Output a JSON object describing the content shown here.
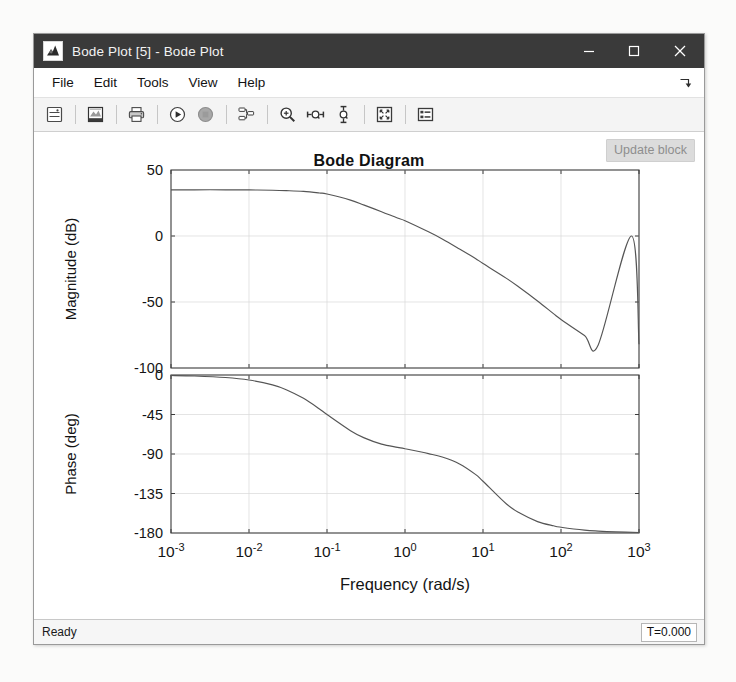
{
  "window": {
    "title": "Bode Plot [5] - Bode Plot",
    "app_icon": "matlab-membrane-icon",
    "controls": {
      "minimize": "minimize-icon",
      "maximize": "maximize-icon",
      "close": "close-icon"
    }
  },
  "menubar": {
    "items": [
      {
        "label": "File"
      },
      {
        "label": "Edit"
      },
      {
        "label": "Tools"
      },
      {
        "label": "View"
      },
      {
        "label": "Help"
      }
    ],
    "dock_arrow": "undock-arrow-icon"
  },
  "toolbar": {
    "buttons": [
      {
        "name": "print-preview-icon",
        "tip": "Print Preview"
      },
      {
        "name": "image-export-icon",
        "tip": "Export Image"
      },
      {
        "name": "print-icon",
        "tip": "Print"
      },
      {
        "name": "run-icon",
        "tip": "Run"
      },
      {
        "name": "stop-icon",
        "tip": "Stop"
      },
      {
        "name": "linearization-hierarchy-icon",
        "tip": "Linearization"
      },
      {
        "name": "zoom-in-icon",
        "tip": "Zoom In"
      },
      {
        "name": "zoom-x-icon",
        "tip": "Zoom X"
      },
      {
        "name": "zoom-y-icon",
        "tip": "Zoom Y"
      },
      {
        "name": "fit-to-view-icon",
        "tip": "Fit to View"
      },
      {
        "name": "legend-icon",
        "tip": "Legend"
      }
    ]
  },
  "figure": {
    "update_block_label": "Update block",
    "title": "Bode Diagram"
  },
  "statusbar": {
    "status": "Ready",
    "time": "T=0.000"
  },
  "chart_data": {
    "type": "line",
    "title": "Bode Diagram",
    "xlabel": "Frequency  (rad/s)",
    "xscale": "log",
    "xlim": [
      0.001,
      1000
    ],
    "xticks": [
      0.001,
      0.01,
      0.1,
      1,
      10,
      100,
      1000
    ],
    "xticklabels": [
      "10-3",
      "10-2",
      "10-1",
      "100",
      "101",
      "102",
      "103"
    ],
    "xtick_mantissa": "10",
    "xtick_exponents": [
      "-3",
      "-2",
      "-1",
      "0",
      "1",
      "2",
      "3"
    ],
    "grid": true,
    "legend": null,
    "subplots": [
      {
        "name": "magnitude",
        "ylabel": "Magnitude (dB)",
        "ylim": [
          -100,
          50
        ],
        "yticks": [
          50,
          0,
          -50,
          -100
        ],
        "yticklabels": [
          "50",
          "0",
          "-50",
          "-100"
        ],
        "x": [
          0.001,
          0.002,
          0.005,
          0.01,
          0.02,
          0.03,
          0.05,
          0.08,
          0.1,
          0.2,
          0.3,
          0.5,
          0.8,
          1,
          2,
          3,
          5,
          8,
          10,
          20,
          30,
          50,
          80,
          100,
          200,
          300,
          500,
          800,
          1000
        ],
        "y": [
          35.0,
          35.0,
          35.0,
          34.9,
          34.7,
          34.4,
          33.8,
          32.6,
          31.8,
          27.2,
          23.4,
          18.4,
          13.6,
          11.6,
          3.2,
          -2.2,
          -9.8,
          -17.0,
          -20.9,
          -32.1,
          -39.4,
          -49.2,
          -58.8,
          -63.2,
          -75.4,
          -82.5,
          0,
          0,
          -82.0
        ]
      },
      {
        "name": "phase",
        "ylabel": "Phase (deg)",
        "ylim": [
          -180,
          0
        ],
        "yticks": [
          0,
          -45,
          -90,
          -135,
          -180
        ],
        "yticklabels": [
          "0",
          "-45",
          "-90",
          "-135",
          "-180"
        ],
        "x": [
          0.001,
          0.002,
          0.005,
          0.01,
          0.02,
          0.03,
          0.05,
          0.08,
          0.1,
          0.2,
          0.3,
          0.5,
          0.8,
          1,
          2,
          3,
          5,
          8,
          10,
          20,
          30,
          50,
          80,
          100,
          200,
          300,
          500,
          1000
        ],
        "y": [
          -0.6,
          -1.2,
          -2.9,
          -5.7,
          -11.3,
          -16.7,
          -26.6,
          -38.7,
          -45.0,
          -63.4,
          -71.6,
          -78.7,
          -82.4,
          -84.0,
          -89.6,
          -93.5,
          -101.3,
          -113.2,
          -121.0,
          -147.0,
          -157.6,
          -167.0,
          -171.8,
          -173.4,
          -176.7,
          -177.8,
          -178.7,
          -179.4
        ]
      }
    ]
  }
}
